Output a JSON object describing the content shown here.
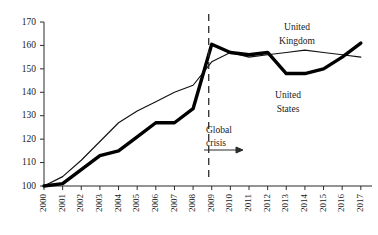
{
  "chart_data": {
    "type": "line",
    "title": "",
    "subtitle": "",
    "xlabel": "",
    "ylabel": "",
    "x": [
      2000,
      2001,
      2002,
      2003,
      2004,
      2005,
      2006,
      2007,
      2008,
      2009,
      2010,
      2011,
      2012,
      2013,
      2014,
      2015,
      2016,
      2017
    ],
    "categories": [
      "2000",
      "2001",
      "2002",
      "2003",
      "2004",
      "2005",
      "2006",
      "2007",
      "2008",
      "2009",
      "2010",
      "2011",
      "2012",
      "2013",
      "2014",
      "2015",
      "2016",
      "2017"
    ],
    "ylim": [
      100,
      170
    ],
    "yticks": [
      100,
      110,
      120,
      130,
      140,
      150,
      160,
      170
    ],
    "ytick_labels": [
      "100",
      "110",
      "120",
      "130",
      "140",
      "150",
      "160",
      "170"
    ],
    "grid": false,
    "legend_position": "inline-labels",
    "series": [
      {
        "name": "United Kingdom",
        "style": "thin",
        "values": [
          100,
          104,
          111,
          119,
          127,
          132,
          136,
          140,
          143,
          153,
          157,
          155,
          156,
          157,
          158,
          157,
          156,
          155
        ]
      },
      {
        "name": "United States",
        "style": "thick",
        "values": [
          100,
          101,
          107,
          113,
          115,
          121,
          127,
          127,
          133,
          160.5,
          157,
          156,
          157,
          148,
          148,
          150,
          155,
          161
        ]
      }
    ],
    "annotations": [
      {
        "name": "global-crisis",
        "text_line1": "Global",
        "text_line2": "crisis",
        "marker": "dashed-vertical-line",
        "at_x": 2009,
        "arrow": "right"
      }
    ]
  },
  "labels": {
    "uk_line1": "United",
    "uk_line2": "Kingdom",
    "us_line1": "United",
    "us_line2": "States"
  },
  "colors": {
    "axis": "#2b2b2b",
    "series_uk": "#111111",
    "series_us": "#000000",
    "background": "#ffffff"
  }
}
